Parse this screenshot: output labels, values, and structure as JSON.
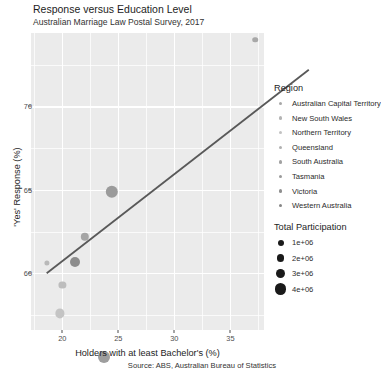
{
  "header": {
    "title": "Response versus Education Level",
    "subtitle": "Australian Marriage Law Postal Survey, 2017"
  },
  "caption": "Source: ABS, Australian Bureau of Statistics",
  "legends": {
    "region": {
      "title": "Region",
      "items": [
        {
          "label": "Australian Capital Territory",
          "color": "#a8a8a8"
        },
        {
          "label": "New South Wales",
          "color": "#b4b4b4"
        },
        {
          "label": "Northern Territory",
          "color": "#c2c2c2"
        },
        {
          "label": "Queensland",
          "color": "#b0b0b0"
        },
        {
          "label": "South Australia",
          "color": "#a2a2a2"
        },
        {
          "label": "Tasmania",
          "color": "#9a9a9a"
        },
        {
          "label": "Victoria",
          "color": "#8f8f8f"
        },
        {
          "label": "Western Australia",
          "color": "#868686"
        }
      ]
    },
    "size": {
      "title": "Total Participation",
      "items": [
        {
          "label": "1e+06",
          "radius": 3.0
        },
        {
          "label": "2e+06",
          "radius": 3.9
        },
        {
          "label": "3e+06",
          "radius": 4.8
        },
        {
          "label": "4e+06",
          "radius": 5.8
        }
      ]
    }
  },
  "chart_data": {
    "type": "scatter",
    "title": "Response versus Education Level",
    "subtitle": "Australian Marriage Law Postal Survey, 2017",
    "xlabel": "Holders with at least Bachelor's (%)",
    "ylabel": "'Yes' Response (%)",
    "xlim": [
      17.2,
      38.0
    ],
    "ylim": [
      56.6,
      74.4
    ],
    "xticks": [
      20,
      25,
      30,
      35
    ],
    "yticks": [
      60,
      65,
      70
    ],
    "grid": true,
    "legend_position": "right",
    "color_legend_title": "Region",
    "size_legend_title": "Total Participation",
    "size_variable": "Total Participation",
    "points": [
      {
        "region": "Australian Capital Territory",
        "x": 37.2,
        "y": 74.0,
        "participation": 270000,
        "radius": 2.8,
        "color": "#a8a8a8"
      },
      {
        "region": "New South Wales",
        "x": 24.4,
        "y": 64.9,
        "participation": 4600000,
        "radius": 6.2,
        "color": "#9b9b9b"
      },
      {
        "region": "Northern Territory",
        "x": 18.6,
        "y": 60.6,
        "participation": 100000,
        "radius": 2.6,
        "color": "#b9b9b9"
      },
      {
        "region": "Queensland",
        "x": 21.1,
        "y": 60.7,
        "participation": 2900000,
        "radius": 5.0,
        "color": "#8c8c8c"
      },
      {
        "region": "South Australia",
        "x": 20.0,
        "y": 59.3,
        "participation": 1100000,
        "radius": 3.6,
        "color": "#bdbdbd"
      },
      {
        "region": "Tasmania",
        "x": 19.8,
        "y": 57.6,
        "participation": 350000,
        "radius": 4.6,
        "color": "#c4c4c4"
      },
      {
        "region": "Victoria",
        "x": 23.7,
        "y": 55.0,
        "participation": 3800000,
        "radius": 6.0,
        "color": "#9e9e9e"
      },
      {
        "region": "Western Australia",
        "x": 22.0,
        "y": 62.2,
        "participation": 1500000,
        "radius": 4.2,
        "color": "#a5a5a5"
      }
    ],
    "trendline": {
      "x_start": 18.6,
      "y_start": 60.0,
      "x_end": 42.0,
      "y_end": 72.2,
      "color": "#595959"
    }
  }
}
